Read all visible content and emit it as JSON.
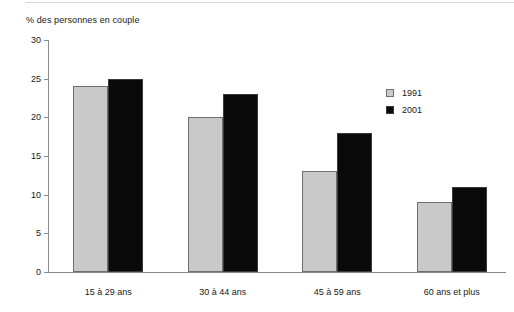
{
  "chart_data": {
    "type": "bar",
    "title": "% des personnes en couple",
    "xlabel": "",
    "ylabel": "% des personnes en couple",
    "categories": [
      "15 à 29 ans",
      "30 à 44 ans",
      "45 à 59 ans",
      "60 ans et plus"
    ],
    "series": [
      {
        "name": "1991",
        "values": [
          24,
          20,
          13,
          9
        ],
        "color": "#c9c9c9"
      },
      {
        "name": "2001",
        "values": [
          25,
          23,
          18,
          11
        ],
        "color": "#0a0a0a"
      }
    ],
    "ylim": [
      0,
      30
    ],
    "yticks": [
      0,
      5,
      10,
      15,
      20,
      25,
      30
    ],
    "ytick_labels": [
      "0",
      "5",
      "10",
      "15",
      "20",
      "25",
      "30"
    ],
    "grid": false,
    "legend_position": "upper right"
  }
}
